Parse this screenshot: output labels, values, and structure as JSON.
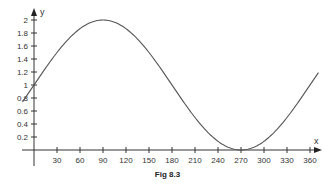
{
  "caption": "Fig 8.3",
  "chart_data": {
    "type": "line",
    "title": "",
    "caption": "Fig 8.3",
    "xlabel": "x",
    "ylabel": "y",
    "function": "y = 1 + sin(x)",
    "x_ticks": [
      30,
      60,
      90,
      120,
      150,
      180,
      210,
      240,
      270,
      300,
      330,
      360
    ],
    "y_ticks": [
      0.2,
      0.4,
      0.6,
      0.8,
      1,
      1.2,
      1.4,
      1.6,
      1.8,
      2
    ],
    "xlim": [
      0,
      360
    ],
    "ylim": [
      0,
      2
    ],
    "grid": false,
    "legend": null,
    "series": [
      {
        "name": "y = 1 + sin x",
        "x": [
          -15,
          0,
          30,
          60,
          90,
          120,
          150,
          180,
          210,
          240,
          270,
          300,
          330,
          360,
          372
        ],
        "values": [
          0.74,
          1,
          1.5,
          1.87,
          2,
          1.87,
          1.5,
          1,
          0.5,
          0.13,
          0,
          0.13,
          0.5,
          1,
          1.21
        ]
      }
    ],
    "color": "#555555"
  }
}
